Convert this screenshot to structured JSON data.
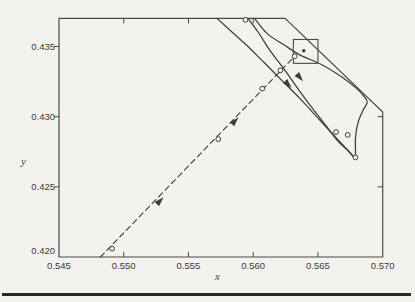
{
  "figure": {
    "background_color": "#f3f2ee",
    "ink_color": "#3e3d39",
    "frame_color": "#4a4944",
    "rule_color": "#2a2823",
    "marker_fill": "#f4f3ef",
    "text_color": "#3c3b36"
  },
  "chart_data": {
    "type": "line",
    "title": "",
    "xlabel": "x",
    "ylabel": "y",
    "xlim": [
      0.545,
      0.57
    ],
    "ylim": [
      0.42,
      0.437
    ],
    "grid": false,
    "legend": "none",
    "x_tick_labels": [
      "0.545",
      "0.550",
      "0.555",
      "0.560",
      "0.565",
      "0.570"
    ],
    "x_tick_values": [
      0.545,
      0.55,
      0.555,
      0.56,
      0.565,
      0.57
    ],
    "y_tick_labels": [
      "0.420",
      "0.425",
      "0.430",
      "0.435"
    ],
    "y_tick_values": [
      0.42,
      0.425,
      0.43,
      0.435
    ],
    "bottom_tick_values": [
      0.55,
      0.555,
      0.56,
      0.565
    ],
    "top_tick_values": [
      0.55,
      0.555,
      0.56
    ],
    "left_tick_values": [
      0.425,
      0.43,
      0.435
    ],
    "right_tick_values": [
      0.425,
      0.43
    ],
    "frame_polygon": [
      [
        0.545,
        0.437
      ],
      [
        0.56246,
        0.437
      ],
      [
        0.57,
        0.43033
      ],
      [
        0.57,
        0.42
      ],
      [
        0.545,
        0.42
      ]
    ],
    "series": [
      {
        "name": "incoming-trajectory",
        "style": "dashed",
        "points": [
          [
            0.5482,
            0.42
          ],
          [
            0.5632,
            0.4343
          ]
        ],
        "markers": [
          [
            0.5491,
            0.4206
          ],
          [
            0.5573,
            0.4284
          ],
          [
            0.5607,
            0.432
          ],
          [
            0.5621,
            0.4333
          ],
          [
            0.5632,
            0.4343
          ]
        ],
        "arrows": [
          {
            "at": [
              0.5528,
              0.424
            ],
            "angle": -46
          },
          {
            "at": [
              0.5586,
              0.4297
            ],
            "angle": -47
          }
        ]
      },
      {
        "name": "outer-trajectory",
        "style": "solid",
        "points": [
          [
            0.5572,
            0.437
          ],
          [
            0.5584,
            0.436
          ],
          [
            0.5596,
            0.435
          ],
          [
            0.5609,
            0.4338
          ],
          [
            0.5623,
            0.4325
          ],
          [
            0.5636,
            0.4313
          ],
          [
            0.5649,
            0.43
          ],
          [
            0.5662,
            0.4287
          ],
          [
            0.5671,
            0.4278
          ],
          [
            0.5677,
            0.4272
          ]
        ],
        "markers": [
          [
            0.5664,
            0.4289
          ]
        ],
        "arrows": [
          {
            "at": [
              0.5627,
              0.4323
            ],
            "angle": 46
          }
        ]
      },
      {
        "name": "cycle-branch-left",
        "style": "solid",
        "points": [
          [
            0.5596,
            0.437
          ],
          [
            0.5604,
            0.436
          ],
          [
            0.5613,
            0.4347
          ],
          [
            0.5623,
            0.4335
          ],
          [
            0.5633,
            0.4322
          ],
          [
            0.5644,
            0.4308
          ],
          [
            0.5655,
            0.4295
          ],
          [
            0.5665,
            0.4283
          ],
          [
            0.5673,
            0.4276
          ],
          [
            0.5678,
            0.4271
          ]
        ],
        "markers": [
          [
            0.5594,
            0.4369
          ],
          [
            0.5673,
            0.4287
          ]
        ],
        "arrows": [
          {
            "at": [
              0.5636,
              0.4328
            ],
            "angle": 50
          }
        ]
      },
      {
        "name": "cycle-branch-right",
        "style": "solid",
        "points": [
          [
            0.5601,
            0.437
          ],
          [
            0.5611,
            0.4359
          ],
          [
            0.5624,
            0.4351
          ],
          [
            0.5636,
            0.4344
          ],
          [
            0.5653,
            0.4337
          ],
          [
            0.5669,
            0.4328
          ],
          [
            0.568,
            0.432
          ],
          [
            0.5686,
            0.4314
          ],
          [
            0.5688,
            0.431
          ],
          [
            0.5685,
            0.4305
          ],
          [
            0.5681,
            0.4296
          ],
          [
            0.5679,
            0.4285
          ],
          [
            0.5679,
            0.4276
          ],
          [
            0.5679,
            0.4271
          ]
        ],
        "markers": [
          [
            0.5679,
            0.4271
          ]
        ],
        "arrows": []
      }
    ],
    "annotations": {
      "fixed_point": {
        "x": 0.5639,
        "y": 0.4347
      },
      "inset_box": {
        "x": [
          0.5631,
          0.565
        ],
        "y": [
          0.4338,
          0.4355
        ]
      }
    },
    "pixel_mapping": {
      "x0_px": 59,
      "y0_px": 257,
      "x_px_per_unit": 12948,
      "y_px_per_unit": 14033
    }
  }
}
